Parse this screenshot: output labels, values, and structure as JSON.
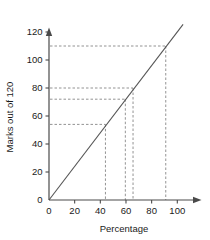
{
  "chart_data": {
    "type": "line",
    "title": "",
    "xlabel": "Percentage",
    "ylabel": "Marks out of 120",
    "xlim": [
      0,
      105
    ],
    "ylim": [
      0,
      126
    ],
    "grid": false,
    "legend": null,
    "xticks": [
      0,
      20,
      40,
      60,
      80,
      100
    ],
    "xtick_labels": [
      "0",
      "20",
      "40",
      "60",
      "80",
      "100"
    ],
    "yticks": [
      0,
      20,
      40,
      60,
      80,
      100,
      120
    ],
    "ytick_labels": [
      "0",
      "20",
      "40",
      "60",
      "80",
      "100",
      "120"
    ],
    "series": [
      {
        "name": "conversion",
        "type": "line",
        "color": "#555555",
        "x": [
          0,
          100
        ],
        "values": [
          0,
          120
        ]
      }
    ],
    "guide_lines": [
      {
        "name": "guide-1",
        "x": 44.0,
        "y": 54.0,
        "style": "dashed",
        "color": "#777777"
      },
      {
        "name": "guide-2",
        "x": 59.5,
        "y": 72.0,
        "style": "dashed",
        "color": "#777777"
      },
      {
        "name": "guide-3",
        "x": 65.5,
        "y": 80.0,
        "style": "dashed",
        "color": "#777777"
      },
      {
        "name": "guide-4",
        "x": 91.0,
        "y": 110.0,
        "style": "dashed",
        "color": "#777777"
      }
    ]
  }
}
